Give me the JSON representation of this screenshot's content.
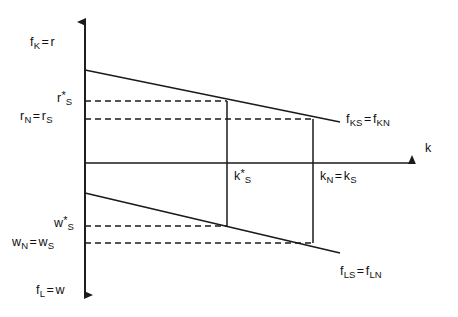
{
  "figure": {
    "background_color": "#ffffff",
    "line_color": "#1a1a1a"
  },
  "axes": {
    "vertical": {
      "top_label": {
        "base": "f",
        "sub": "K",
        "eq": "=",
        "rhs": "r"
      },
      "bottom_label": {
        "base": "f",
        "sub": "L",
        "eq": "=",
        "rhs": "w"
      },
      "x": 85,
      "y_top": 15,
      "y_bottom": 302,
      "arrows": "both"
    },
    "horizontal": {
      "label": "k",
      "y": 163,
      "x_start": 85,
      "x_end": 420,
      "arrows": "right"
    }
  },
  "curves": [
    {
      "name": "capital-rental-curve",
      "label": {
        "base1": "f",
        "sub1": "KS",
        "eq": "=",
        "base2": "f",
        "sub2": "KN"
      },
      "x1": 85,
      "y1": 70,
      "x2": 340,
      "y2": 122
    },
    {
      "name": "labour-wage-curve",
      "label": {
        "base1": "f",
        "sub1": "LS",
        "eq": "=",
        "base2": "f",
        "sub2": "LN"
      },
      "x1": 85,
      "y1": 193,
      "x2": 340,
      "y2": 253
    }
  ],
  "verticals": [
    {
      "name": "k-star-S-line",
      "x": 227,
      "y_top": 101,
      "y_bottom": 226
    },
    {
      "name": "k-N-equals-k-S-line",
      "x": 313,
      "y_top": 119,
      "y_bottom": 243
    }
  ],
  "dashed_levels": [
    {
      "name": "r-star-S-level",
      "y": 101,
      "x_start": 85,
      "x_end": 227
    },
    {
      "name": "r-N-equals-r-S-level",
      "y": 119,
      "x_start": 85,
      "x_end": 313
    },
    {
      "name": "w-star-S-level",
      "y": 226,
      "x_start": 85,
      "x_end": 227
    },
    {
      "name": "w-N-equals-w-S-level",
      "y": 243,
      "x_start": 85,
      "x_end": 313
    }
  ],
  "labels": {
    "f_K_eq_r": {
      "base": "f",
      "sub": "K",
      "eq": "=",
      "rhs": "r"
    },
    "r_star_S": {
      "base": "r",
      "sup": "*",
      "sub": "S"
    },
    "r_N_eq_r_S": {
      "base1": "r",
      "sub1": "N",
      "eq": "=",
      "base2": "r",
      "sub2": "S"
    },
    "f_KS_eq_f_KN": {
      "base1": "f",
      "sub1": "KS",
      "eq": "=",
      "base2": "f",
      "sub2": "KN"
    },
    "k_axis": "k",
    "k_star_S": {
      "base": "k",
      "sup": "*",
      "sub": "S"
    },
    "k_N_eq_k_S": {
      "base1": "k",
      "sub1": "N",
      "eq": "=",
      "base2": "k",
      "sub2": "S"
    },
    "w_star_S": {
      "base": "w",
      "sup": "*",
      "sub": "S"
    },
    "w_N_eq_w_S": {
      "base1": "w",
      "sub1": "N",
      "eq": "=",
      "base2": "w",
      "sub2": "S"
    },
    "f_LS_eq_f_LN": {
      "base1": "f",
      "sub1": "LS",
      "eq": "=",
      "base2": "f",
      "sub2": "LN"
    },
    "f_L_eq_w": {
      "base": "f",
      "sub": "L",
      "eq": "=",
      "rhs": "w"
    }
  }
}
